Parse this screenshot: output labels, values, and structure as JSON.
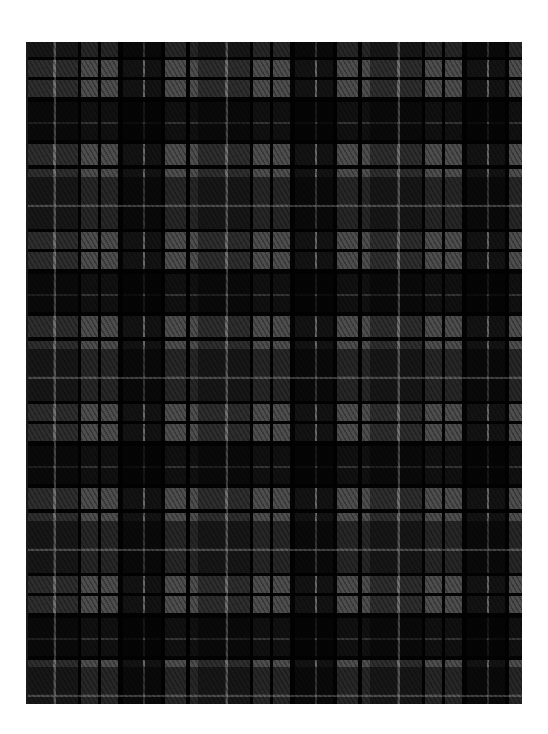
{
  "image": {
    "subject": "tartan plaid fabric swatch",
    "colors": {
      "background": "#ffffff",
      "base_grey": "#4e4e4e",
      "pale_grey_line": "#828282",
      "dark_band": "#141414",
      "black_line": "#000000"
    },
    "swatch": {
      "x": 26,
      "y": 42,
      "width": 496,
      "height": 662
    },
    "sett_period_px": 172,
    "pattern": "grey/black tartan with twill hatching; repeating dark checks and pale grey overcheck lines"
  }
}
